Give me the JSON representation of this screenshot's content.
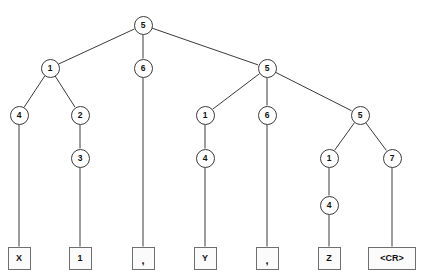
{
  "diagram": {
    "type": "tree",
    "stroke_color": "#3a3a3a",
    "box_border_color": "#6f6f6f",
    "background": "#ffffff",
    "nodes": [
      {
        "id": "n0",
        "label": "5",
        "x": 143,
        "y": 25,
        "shape": "circle"
      },
      {
        "id": "n1",
        "label": "1",
        "x": 50,
        "y": 68,
        "shape": "circle"
      },
      {
        "id": "n2",
        "label": "6",
        "x": 143,
        "y": 68,
        "shape": "circle"
      },
      {
        "id": "n3",
        "label": "5",
        "x": 267,
        "y": 68,
        "shape": "circle"
      },
      {
        "id": "n4",
        "label": "4",
        "x": 19,
        "y": 115,
        "shape": "circle"
      },
      {
        "id": "n5",
        "label": "2",
        "x": 80,
        "y": 115,
        "shape": "circle"
      },
      {
        "id": "n6",
        "label": "1",
        "x": 205,
        "y": 115,
        "shape": "circle"
      },
      {
        "id": "n7",
        "label": "6",
        "x": 267,
        "y": 115,
        "shape": "circle"
      },
      {
        "id": "n8",
        "label": "5",
        "x": 360,
        "y": 115,
        "shape": "circle"
      },
      {
        "id": "n9",
        "label": "3",
        "x": 80,
        "y": 158,
        "shape": "circle"
      },
      {
        "id": "n10",
        "label": "4",
        "x": 205,
        "y": 158,
        "shape": "circle"
      },
      {
        "id": "n11",
        "label": "1",
        "x": 329,
        "y": 158,
        "shape": "circle"
      },
      {
        "id": "n12",
        "label": "7",
        "x": 392,
        "y": 158,
        "shape": "circle"
      },
      {
        "id": "n13",
        "label": "4",
        "x": 329,
        "y": 205,
        "shape": "circle"
      }
    ],
    "leaves": [
      {
        "id": "l0",
        "label": "X",
        "x": 19,
        "y": 258,
        "width": 23,
        "comma": false
      },
      {
        "id": "l1",
        "label": "1",
        "x": 80,
        "y": 258,
        "width": 23,
        "comma": false
      },
      {
        "id": "l2",
        "label": ",",
        "x": 143,
        "y": 258,
        "width": 23,
        "comma": true
      },
      {
        "id": "l3",
        "label": "Y",
        "x": 205,
        "y": 258,
        "width": 23,
        "comma": false
      },
      {
        "id": "l4",
        "label": ",",
        "x": 267,
        "y": 258,
        "width": 23,
        "comma": true
      },
      {
        "id": "l5",
        "label": "Z",
        "x": 329,
        "y": 258,
        "width": 23,
        "comma": false
      },
      {
        "id": "l6",
        "label": "<CR>",
        "x": 392,
        "y": 258,
        "width": 48,
        "comma": false
      }
    ],
    "edges": [
      {
        "from": "n0",
        "to": "n1"
      },
      {
        "from": "n0",
        "to": "n2"
      },
      {
        "from": "n0",
        "to": "n3"
      },
      {
        "from": "n1",
        "to": "n4"
      },
      {
        "from": "n1",
        "to": "n5"
      },
      {
        "from": "n3",
        "to": "n6"
      },
      {
        "from": "n3",
        "to": "n7"
      },
      {
        "from": "n3",
        "to": "n8"
      },
      {
        "from": "n5",
        "to": "n9"
      },
      {
        "from": "n6",
        "to": "n10"
      },
      {
        "from": "n8",
        "to": "n11"
      },
      {
        "from": "n8",
        "to": "n12"
      },
      {
        "from": "n11",
        "to": "n13"
      },
      {
        "from": "n4",
        "to": "l0"
      },
      {
        "from": "n9",
        "to": "l1"
      },
      {
        "from": "n2",
        "to": "l2"
      },
      {
        "from": "n10",
        "to": "l3"
      },
      {
        "from": "n7",
        "to": "l4"
      },
      {
        "from": "n13",
        "to": "l5"
      },
      {
        "from": "n12",
        "to": "l6"
      }
    ]
  }
}
